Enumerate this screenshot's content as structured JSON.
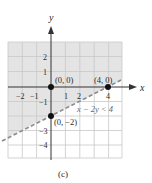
{
  "figure": {
    "caption": "(c)",
    "axes": {
      "x_label": "x",
      "y_label": "y",
      "x_ticks": [
        {
          "value": -2,
          "label": "−2"
        },
        {
          "value": -1,
          "label": "−1"
        },
        {
          "value": 1,
          "label": "1"
        },
        {
          "value": 2,
          "label": "2"
        },
        {
          "value": 4,
          "label": "4"
        }
      ],
      "y_ticks": [
        {
          "value": 2,
          "label": "2"
        },
        {
          "value": 1,
          "label": "1"
        },
        {
          "value": -1,
          "label": "−1"
        },
        {
          "value": -3,
          "label": "−3"
        },
        {
          "value": -4,
          "label": "−4"
        }
      ],
      "x_range": [
        -3,
        5
      ],
      "y_range": [
        -5,
        3
      ]
    },
    "boundary": {
      "equation": "x − 2y = 4",
      "style": "dashed",
      "inequality_label": "x − 2y < 4"
    },
    "points": [
      {
        "x": 0,
        "y": 0,
        "label": "(0, 0)"
      },
      {
        "x": 4,
        "y": 0,
        "label": "(4, 0)"
      },
      {
        "x": 0,
        "y": -2,
        "label": "(0, −2)"
      }
    ],
    "colors": {
      "shade": "#e4e4e4",
      "grid": "#c8c8c8",
      "axis": "#333333",
      "boundary": "#8a8a8a",
      "point": "#111111"
    }
  }
}
